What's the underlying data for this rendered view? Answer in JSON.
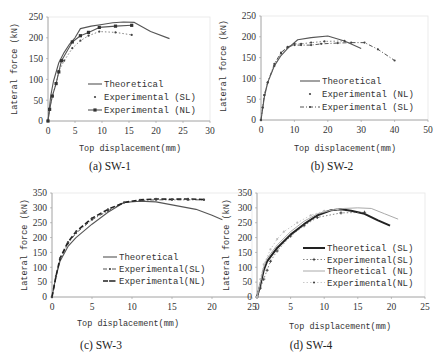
{
  "chart_data": [
    {
      "id": "a",
      "type": "line",
      "caption": "(a) SW-1",
      "xlabel": "Top displacement(mm)",
      "ylabel": "Lateral force (kN)",
      "xlim": [
        0,
        30
      ],
      "ylim": [
        0,
        250
      ],
      "xticks": [
        0,
        5,
        10,
        15,
        20,
        25,
        30
      ],
      "yticks": [
        0,
        50,
        100,
        150,
        200,
        250
      ],
      "grid": false,
      "legend_position": "lower-center",
      "series": [
        {
          "name": "Theoretical",
          "style": "solid",
          "marker": "none",
          "x": [
            0,
            0.5,
            1,
            2,
            3,
            4,
            5,
            6,
            8,
            10,
            12,
            14,
            16,
            19,
            22.5
          ],
          "y": [
            0,
            60,
            95,
            140,
            165,
            185,
            200,
            222,
            228,
            232,
            236,
            238,
            237,
            215,
            198
          ]
        },
        {
          "name": "Experimental (SL)",
          "style": "dotted",
          "marker": "dot",
          "x": [
            0,
            0.3,
            0.8,
            1.5,
            2,
            3,
            4.5,
            6,
            7.5,
            9.5,
            12.5,
            15.5
          ],
          "y": [
            0,
            30,
            60,
            90,
            120,
            145,
            175,
            193,
            205,
            215,
            213,
            207
          ]
        },
        {
          "name": "Experimental (NL)",
          "style": "solid",
          "marker": "square",
          "x": [
            0,
            0.3,
            0.8,
            1.5,
            2,
            2.5,
            4.5,
            6,
            7.5,
            9.5,
            12.5,
            15.5
          ],
          "y": [
            0,
            28,
            60,
            90,
            118,
            145,
            190,
            205,
            213,
            225,
            228,
            230
          ]
        }
      ]
    },
    {
      "id": "b",
      "type": "line",
      "caption": "(b) SW-2",
      "xlabel": "Top displacement(mm)",
      "ylabel": "Lateral force (kN)",
      "xlim": [
        0,
        50
      ],
      "ylim": [
        0,
        250
      ],
      "xticks": [
        0,
        10,
        20,
        30,
        40,
        50
      ],
      "yticks": [
        0,
        50,
        100,
        150,
        200,
        250
      ],
      "grid": false,
      "legend_position": "lower-center",
      "series": [
        {
          "name": "Theoretical",
          "style": "solid",
          "marker": "none",
          "x": [
            0,
            1,
            2,
            4,
            6,
            8,
            11,
            15,
            20,
            25,
            30
          ],
          "y": [
            0,
            55,
            90,
            130,
            155,
            172,
            193,
            198,
            202,
            190,
            172
          ]
        },
        {
          "name": "Experimental (NL)",
          "style": "dotted",
          "marker": "dot",
          "x": [
            0,
            0.5,
            1,
            2,
            4,
            6,
            8,
            10,
            12,
            15,
            19,
            25
          ],
          "y": [
            0,
            30,
            60,
            90,
            130,
            160,
            175,
            183,
            183,
            186,
            189,
            190
          ]
        },
        {
          "name": "Experimental (SL)",
          "style": "dashdot",
          "marker": "dot",
          "x": [
            0,
            0.5,
            1,
            2,
            4,
            6,
            8,
            10,
            12,
            15,
            18,
            23,
            27,
            31,
            35,
            40
          ],
          "y": [
            0,
            30,
            60,
            90,
            135,
            162,
            176,
            180,
            180,
            180,
            183,
            185,
            186,
            186,
            170,
            143
          ]
        }
      ]
    },
    {
      "id": "c",
      "type": "line",
      "caption": "(c) SW-3",
      "xlabel": "Top displacement(mm)",
      "ylabel": "Lateral force (kN)",
      "xlim": [
        0,
        25
      ],
      "ylim": [
        0,
        350
      ],
      "xticks": [
        0,
        5,
        10,
        15,
        20,
        25
      ],
      "yticks": [
        0,
        50,
        100,
        150,
        200,
        250,
        300,
        350
      ],
      "grid": false,
      "legend_position": "lower-center",
      "series": [
        {
          "name": "Theoretical",
          "style": "solid",
          "marker": "none",
          "x": [
            0,
            0.5,
            1,
            2,
            3,
            5,
            7,
            9,
            11,
            13,
            15,
            18,
            20,
            21.3
          ],
          "y": [
            0,
            70,
            120,
            170,
            200,
            245,
            285,
            318,
            322,
            320,
            310,
            295,
            275,
            260
          ]
        },
        {
          "name": "Experimental(SL)",
          "style": "dashdot",
          "marker": "dot",
          "x": [
            0,
            0.5,
            1,
            2,
            3,
            5,
            7,
            9,
            11,
            13,
            15,
            17,
            19
          ],
          "y": [
            0,
            70,
            125,
            180,
            215,
            260,
            290,
            318,
            325,
            327,
            327,
            327,
            327
          ]
        },
        {
          "name": "Experimental(NL)",
          "style": "dashed",
          "marker": "dot",
          "x": [
            0,
            0.5,
            1,
            2,
            3,
            5,
            7,
            9,
            11,
            13,
            15,
            17,
            19
          ],
          "y": [
            0,
            70,
            130,
            185,
            220,
            265,
            295,
            318,
            327,
            330,
            329,
            330,
            328
          ]
        }
      ]
    },
    {
      "id": "d",
      "type": "line",
      "caption": "(d) SW-4",
      "xlabel": "Top displacement(mm)",
      "ylabel": "Lateral force (kN)",
      "xlim": [
        0,
        25
      ],
      "ylim": [
        0,
        350
      ],
      "xticks": [
        0,
        5,
        10,
        15,
        20,
        25
      ],
      "yticks": [
        0,
        50,
        100,
        150,
        200,
        250,
        300,
        350
      ],
      "grid": false,
      "legend_position": "lower-right",
      "series": [
        {
          "name": "Theoretical (SL)",
          "style": "solid-bold",
          "marker": "none",
          "x": [
            0,
            0.5,
            1,
            1.5,
            2,
            3,
            5,
            7,
            9,
            11,
            12.5,
            14,
            16,
            18,
            19.8
          ],
          "y": [
            0,
            40,
            90,
            120,
            135,
            165,
            210,
            245,
            275,
            292,
            295,
            290,
            280,
            258,
            240
          ]
        },
        {
          "name": "Experimental(SL)",
          "style": "dotted",
          "marker": "plus",
          "x": [
            0,
            0.5,
            1,
            1.5,
            2,
            3,
            5,
            7,
            9,
            12.5,
            16
          ],
          "y": [
            0,
            30,
            60,
            90,
            120,
            155,
            205,
            240,
            268,
            283,
            285
          ]
        },
        {
          "name": "Theoretical (NL)",
          "style": "solid-light",
          "marker": "none",
          "x": [
            0,
            0.5,
            1,
            1.5,
            2,
            3,
            5,
            7,
            9,
            11,
            13,
            15,
            17,
            19,
            21
          ],
          "y": [
            0,
            50,
            100,
            130,
            145,
            175,
            220,
            255,
            280,
            292,
            298,
            300,
            298,
            280,
            262
          ]
        },
        {
          "name": "Experimental(NL)",
          "style": "dotted-light",
          "marker": "dot",
          "x": [
            0,
            0.5,
            1,
            2,
            3,
            4,
            6,
            8,
            10,
            12
          ],
          "y": [
            0,
            60,
            110,
            160,
            195,
            220,
            250,
            275,
            290,
            295
          ]
        }
      ]
    }
  ]
}
